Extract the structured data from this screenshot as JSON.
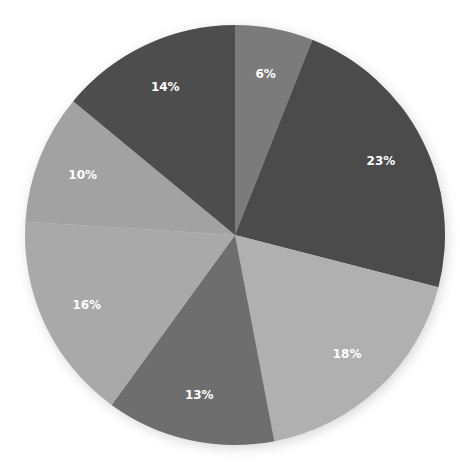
{
  "chart_data": {
    "type": "pie",
    "title": "",
    "legend": null,
    "start_angle_deg": 0,
    "direction": "clockwise",
    "center": [
      235,
      235
    ],
    "radius": 210,
    "slices": [
      {
        "label": "6%",
        "value": 6,
        "color": "#7b7b7b"
      },
      {
        "label": "23%",
        "value": 23,
        "color": "#4b4b4b"
      },
      {
        "label": "18%",
        "value": 18,
        "color": "#b0b0b0"
      },
      {
        "label": "13%",
        "value": 13,
        "color": "#6e6e6e"
      },
      {
        "label": "16%",
        "value": 16,
        "color": "#a9a9a9"
      },
      {
        "label": "10%",
        "value": 10,
        "color": "#a2a2a2"
      },
      {
        "label": "14%",
        "value": 14,
        "color": "#4d4d4d"
      }
    ],
    "values": [
      6,
      23,
      18,
      13,
      16,
      10,
      14
    ],
    "categories": [
      "6%",
      "23%",
      "18%",
      "13%",
      "16%",
      "10%",
      "14%"
    ]
  }
}
